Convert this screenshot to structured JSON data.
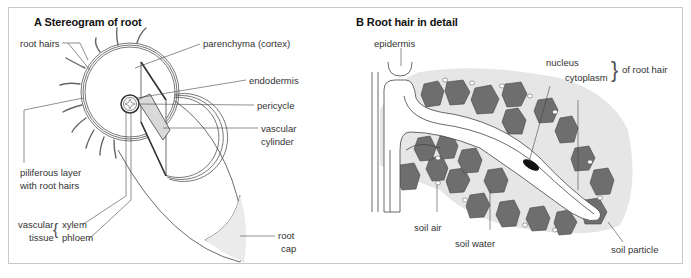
{
  "panel_a": {
    "title": "A Stereogram of root",
    "labels": {
      "root_hairs": "root hairs",
      "parenchyma": "parenchyma (cortex)",
      "endodermis": "endodermis",
      "pericycle": "pericycle",
      "vascular_cylinder_1": "vascular",
      "vascular_cylinder_2": "cylinder",
      "piliferous_1": "piliferous layer",
      "piliferous_2": "with root hairs",
      "vascular_tissue_1": "vascular",
      "vascular_tissue_2": "tissue",
      "xylem": "xylem",
      "phloem": "phloem",
      "root_cap_1": "root",
      "root_cap_2": "cap"
    }
  },
  "panel_b": {
    "title": "B Root hair in detail",
    "labels": {
      "epidermis": "epidermis",
      "nucleus": "nucleus",
      "cytoplasm": "cytoplasm",
      "of_root_hair": "of root hair",
      "soil_air": "soil air",
      "soil_water": "soil water",
      "soil_particle": "soil particle"
    }
  },
  "colors": {
    "line": "#444444",
    "soil_particle": "#6e6e6e",
    "water_halo": "#e6e6e6",
    "vascular_strip": "#d9d9d9",
    "frame": "#c8c8c8"
  }
}
